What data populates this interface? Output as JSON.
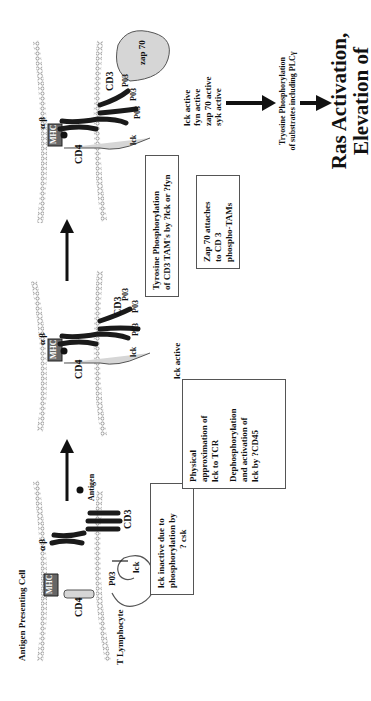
{
  "labels": {
    "apc": "Antigen Presenting Cell",
    "t_lymphocyte": "T Lymphocyte",
    "mhc": "MHC",
    "cd4": "CD4",
    "cd3": "CD3",
    "alpha_beta": "α β",
    "lck": "lck",
    "po3": "P03",
    "antigen": "Antigen",
    "zap70": "zap 70"
  },
  "stage1": {
    "box": [
      "lck inactive due to",
      "phosphorylation by",
      "? csk"
    ]
  },
  "stage2": {
    "box_a": [
      "Physical",
      "approximation of",
      "lck to TCR"
    ],
    "box_b": [
      "Dephosphorylation",
      "and activation of",
      "lck by ?CD45"
    ],
    "status": "lck active"
  },
  "stage3": {
    "box_a": [
      "Tyrosine Phosphorylation",
      "of CD3 TAM's by ?lck or ?fyn"
    ],
    "box_b": [
      "Zap 70 attaches",
      "to CD 3",
      "phospho-TAMs"
    ],
    "status": [
      "lck active",
      "fyn active",
      "zap 70 active",
      "syk active"
    ]
  },
  "downstream": {
    "text": [
      "Tryosine Phosphorylation",
      "of substrates including PLCγ"
    ],
    "outcome": [
      "Ras Activation,",
      "Elevation of"
    ]
  },
  "colors": {
    "membrane": "#9a9a9a",
    "protein_fill": "#d6d6d6",
    "dark": "#1a1a1a",
    "mhc_fill": "#666666"
  }
}
